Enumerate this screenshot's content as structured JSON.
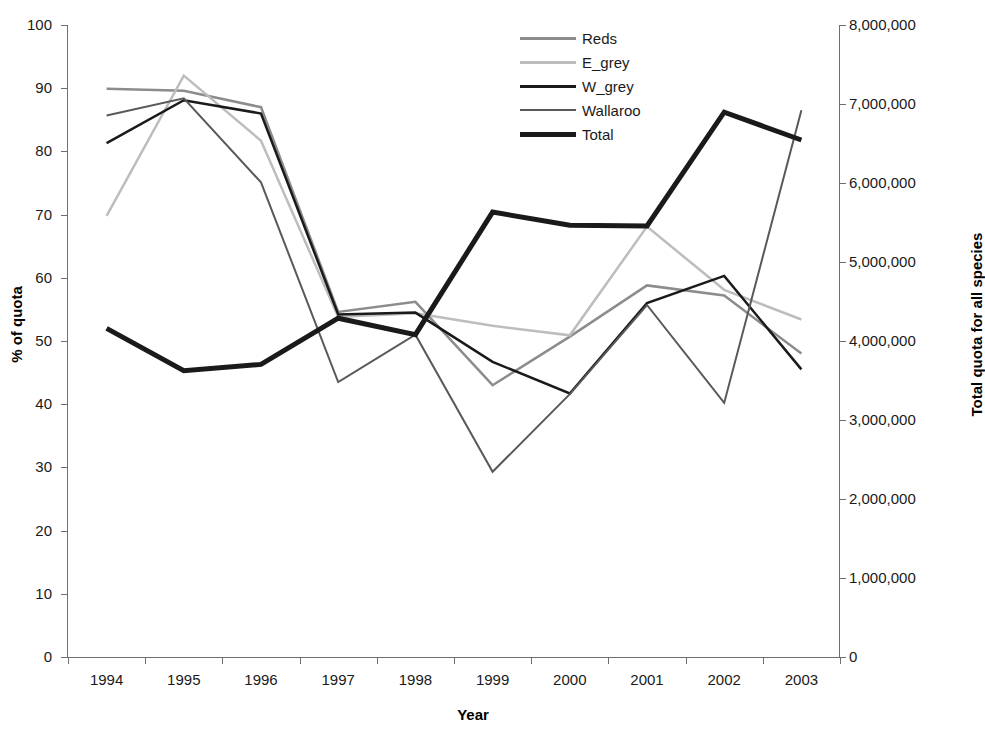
{
  "chart_data": {
    "type": "line",
    "title": "",
    "xlabel": "Year",
    "ylabel": "% of quota",
    "y2label": "Total quota for all species",
    "categories": [
      "1994",
      "1995",
      "1996",
      "1997",
      "1998",
      "1999",
      "2000",
      "2001",
      "2002",
      "2003"
    ],
    "x": [
      1994,
      1995,
      1996,
      1997,
      1998,
      1999,
      2000,
      2001,
      2002,
      2003
    ],
    "ylim": [
      0,
      100
    ],
    "yticks": [
      0,
      10,
      20,
      30,
      40,
      50,
      60,
      70,
      80,
      90,
      100
    ],
    "ytick_labels": [
      "0",
      "10",
      "20",
      "30",
      "40",
      "50",
      "60",
      "70",
      "80",
      "90",
      "100"
    ],
    "y2lim": [
      0,
      8000000
    ],
    "y2ticks": [
      0,
      1000000,
      2000000,
      3000000,
      4000000,
      5000000,
      6000000,
      7000000,
      8000000
    ],
    "y2tick_labels": [
      "0",
      "1,000,000",
      "2,000,000",
      "3,000,000",
      "4,000,000",
      "5,000,000",
      "6,000,000",
      "7,000,000",
      "8,000,000"
    ],
    "grid": false,
    "legend_position": "top-center",
    "series": [
      {
        "name": "Reds",
        "color": "#8c8c8c",
        "width": 2.5,
        "axis": "left",
        "values": [
          89.9,
          89.6,
          87.0,
          54.6,
          56.2,
          43.0,
          50.7,
          58.8,
          57.2,
          48.0
        ]
      },
      {
        "name": "E_grey",
        "color": "#bdbdbd",
        "width": 2.5,
        "axis": "left",
        "values": [
          69.8,
          92.0,
          81.7,
          53.8,
          54.4,
          52.4,
          50.9,
          68.1,
          58.1,
          53.4
        ]
      },
      {
        "name": "W_grey",
        "color": "#1a1a1a",
        "width": 2.5,
        "axis": "left",
        "values": [
          81.3,
          88.1,
          86.0,
          54.2,
          54.5,
          46.7,
          41.7,
          56.0,
          60.3,
          45.5
        ]
      },
      {
        "name": "Wallaroo",
        "color": "#595959",
        "width": 2.0,
        "axis": "left",
        "values": [
          85.7,
          88.4,
          75.1,
          43.5,
          51.0,
          29.3,
          41.6,
          55.7,
          40.2,
          86.5
        ]
      },
      {
        "name": "Total",
        "color": "#1a1a1a",
        "width": 5.0,
        "axis": "left",
        "values": [
          52.0,
          45.3,
          46.3,
          53.6,
          51.0,
          70.4,
          68.3,
          68.2,
          86.2,
          81.8
        ]
      }
    ]
  },
  "legend": {
    "items": [
      {
        "label": "Reds"
      },
      {
        "label": "E_grey"
      },
      {
        "label": "W_grey"
      },
      {
        "label": "Wallaroo"
      },
      {
        "label": "Total"
      }
    ]
  },
  "axes": {
    "left_title": "% of quota",
    "right_title": "Total quota for all species",
    "x_title": "Year"
  }
}
